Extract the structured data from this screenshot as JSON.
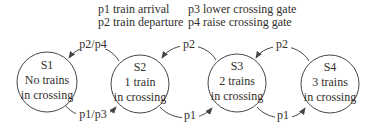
{
  "colors": {
    "background": "#ffffff",
    "line": "#464646",
    "text": "#332f2b"
  },
  "legend": {
    "items": [
      {
        "label": "p1 train arrival"
      },
      {
        "label": "p2 train departure"
      },
      {
        "label": "p3 lower crossing gate"
      },
      {
        "label": "p4 raise crossing gate"
      }
    ]
  },
  "states": [
    {
      "id": "S1",
      "line1": "No trains",
      "line2": "in crossing"
    },
    {
      "id": "S2",
      "line1": "1 train",
      "line2": "in crossing"
    },
    {
      "id": "S3",
      "line1": "2 trains",
      "line2": "in crossing"
    },
    {
      "id": "S4",
      "line1": "3 trains",
      "line2": "in crossing"
    }
  ],
  "transitions": {
    "top": [
      {
        "from": "S2",
        "to": "S1",
        "label": "p2/p4"
      },
      {
        "from": "S3",
        "to": "S2",
        "label": "p2"
      },
      {
        "from": "S4",
        "to": "S3",
        "label": "p2"
      }
    ],
    "bottom": [
      {
        "from": "S1",
        "to": "S2",
        "label": "p1/p3"
      },
      {
        "from": "S2",
        "to": "S3",
        "label": "p1"
      },
      {
        "from": "S3",
        "to": "S4",
        "label": "p1"
      }
    ]
  }
}
